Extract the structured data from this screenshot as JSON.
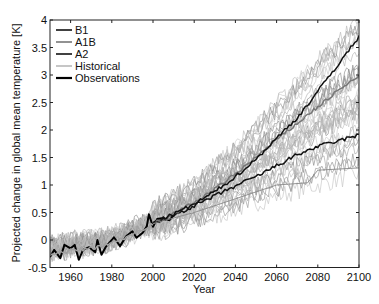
{
  "chart_data": {
    "type": "line",
    "title": "",
    "xlabel": "Year",
    "ylabel": "Projected change in global mean temperature  [K]",
    "xlim": [
      1950,
      2100
    ],
    "ylim": [
      -0.5,
      4
    ],
    "grid": false,
    "legend_position": "upper-left",
    "x_ticks": [
      1960,
      1980,
      2000,
      2020,
      2040,
      2060,
      2080,
      2100
    ],
    "x_tick_labels": [
      "1960",
      "1980",
      "2000",
      "2020",
      "2040",
      "2060",
      "2080",
      "2100"
    ],
    "y_ticks": [
      -0.5,
      0,
      0.5,
      1,
      1.5,
      2,
      2.5,
      3,
      3.5,
      4
    ],
    "y_tick_labels": [
      "-0.5",
      "0",
      "0.5",
      "1",
      "1.5",
      "2",
      "2.5",
      "3",
      "3.5",
      "4"
    ],
    "legend": [
      {
        "label": "B1",
        "color": "#111111",
        "width": 1.6
      },
      {
        "label": "A1B",
        "color": "#777777",
        "width": 1.6
      },
      {
        "label": "A2",
        "color": "#111111",
        "width": 1.6
      },
      {
        "label": "Historical",
        "color": "#a0a0a0",
        "width": 1.2
      },
      {
        "label": "Observations",
        "color": "#000000",
        "width": 2.2
      }
    ],
    "series": [
      {
        "name": "Observations",
        "color": "#000000",
        "x": [
          1950,
          1952,
          1955,
          1957,
          1960,
          1962,
          1964,
          1966,
          1969,
          1972,
          1973,
          1975,
          1977,
          1980,
          1981,
          1984,
          1987,
          1990,
          1992,
          1995,
          1997,
          1998,
          2000,
          2002,
          2005,
          2008,
          2010
        ],
        "values": [
          -0.31,
          -0.18,
          -0.33,
          -0.09,
          -0.15,
          -0.09,
          -0.36,
          -0.18,
          -0.13,
          -0.22,
          0.0,
          -0.27,
          -0.13,
          0.0,
          0.05,
          -0.11,
          0.07,
          0.16,
          0.04,
          0.13,
          0.25,
          0.47,
          0.24,
          0.38,
          0.4,
          0.36,
          0.45
        ]
      },
      {
        "name": "B1",
        "color": "#111111",
        "x": [
          2000,
          2010,
          2020,
          2030,
          2040,
          2050,
          2060,
          2070,
          2080,
          2090,
          2100
        ],
        "values": [
          0.3,
          0.45,
          0.62,
          0.8,
          0.98,
          1.15,
          1.35,
          1.55,
          1.7,
          1.8,
          1.91
        ]
      },
      {
        "name": "A1B",
        "color": "#777777",
        "x": [
          2000,
          2010,
          2020,
          2030,
          2040,
          2050,
          2060,
          2070,
          2080,
          2090,
          2100
        ],
        "values": [
          0.3,
          0.48,
          0.68,
          0.92,
          1.2,
          1.5,
          1.82,
          2.12,
          2.42,
          2.72,
          2.98
        ]
      },
      {
        "name": "A2",
        "color": "#111111",
        "x": [
          2000,
          2010,
          2020,
          2030,
          2040,
          2050,
          2060,
          2070,
          2080,
          2090,
          2100
        ],
        "values": [
          0.3,
          0.47,
          0.65,
          0.88,
          1.15,
          1.47,
          1.85,
          2.22,
          2.7,
          3.2,
          3.69
        ]
      },
      {
        "name": "Historical ensemble (mean)",
        "color": "#a0a0a0",
        "x": [
          1950,
          1960,
          1970,
          1980,
          1990,
          2000
        ],
        "values": [
          -0.25,
          -0.2,
          -0.15,
          -0.05,
          0.1,
          0.3
        ]
      },
      {
        "name": "Low-sensitivity outlier run",
        "color": "#888888",
        "x": [
          2000,
          2020,
          2040,
          2060,
          2075,
          2080,
          2100
        ],
        "values": [
          0.3,
          0.5,
          0.75,
          1.0,
          1.04,
          1.27,
          1.31
        ]
      }
    ],
    "ensemble_envelope": {
      "x": [
        1950,
        1980,
        2000,
        2020,
        2040,
        2060,
        2080,
        2100
      ],
      "lower": [
        -0.5,
        -0.3,
        0.05,
        0.3,
        0.55,
        0.8,
        1.0,
        1.2
      ],
      "upper": [
        0.2,
        0.3,
        0.6,
        1.05,
        1.7,
        2.5,
        3.3,
        4.0
      ]
    }
  }
}
